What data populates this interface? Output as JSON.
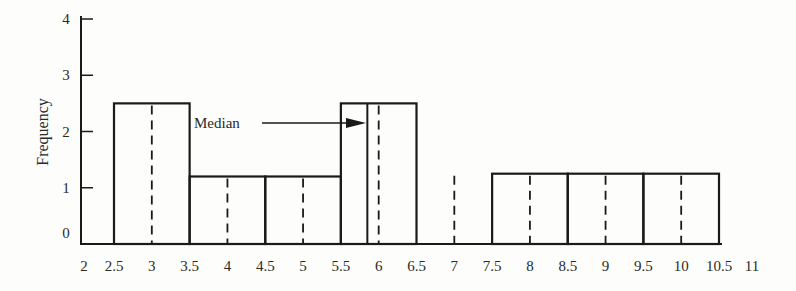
{
  "chart_data": {
    "type": "bar",
    "subtype": "histogram",
    "title": "",
    "xlabel": "",
    "ylabel": "Frequency",
    "xlim": [
      2,
      11
    ],
    "ylim": [
      0,
      4
    ],
    "grid": false,
    "legend": null,
    "x_ticks": [
      "2",
      "2.5",
      "3",
      "3.5",
      "4",
      "4.5",
      "5",
      "5.5",
      "6",
      "6.5",
      "7",
      "7.5",
      "8",
      "8.5",
      "9",
      "9.5",
      "10",
      "10.5",
      "11"
    ],
    "y_ticks": [
      "0",
      "1",
      "2",
      "3",
      "4"
    ],
    "bins": [
      {
        "start": 2.5,
        "end": 3.5,
        "midpoint": 3,
        "height": 2.5
      },
      {
        "start": 3.5,
        "end": 4.5,
        "midpoint": 4,
        "height": 1.2
      },
      {
        "start": 4.5,
        "end": 5.5,
        "midpoint": 5,
        "height": 1.2
      },
      {
        "start": 5.5,
        "end": 6.5,
        "midpoint": 6,
        "height": 2.5
      },
      {
        "start": 6.5,
        "end": 7.5,
        "midpoint": 7,
        "height": 0
      },
      {
        "start": 7.5,
        "end": 8.5,
        "midpoint": 8,
        "height": 1.25
      },
      {
        "start": 8.5,
        "end": 9.5,
        "midpoint": 9,
        "height": 1.25
      },
      {
        "start": 9.5,
        "end": 10.5,
        "midpoint": 10,
        "height": 1.25
      }
    ],
    "categories": [
      "3",
      "4",
      "5",
      "6",
      "7",
      "8",
      "9",
      "10"
    ],
    "values": [
      2.5,
      1.2,
      1.2,
      2.5,
      0,
      1.25,
      1.25,
      1.25
    ],
    "dashed_midpoint_lines": [
      3,
      4,
      5,
      6,
      7,
      8,
      9,
      10
    ],
    "annotations": [
      {
        "text": "Median",
        "x": 5.85,
        "y": 2.2,
        "arrow": true
      }
    ],
    "median_value": 5.85
  }
}
